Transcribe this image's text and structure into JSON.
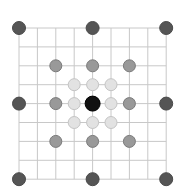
{
  "diagram": {
    "type": "grid-board",
    "grid": {
      "cells": 8,
      "lines": 9,
      "origin_x": 19,
      "origin_y": 28,
      "step_x": 18.4,
      "step_y": 18.9,
      "line_color": "#c8c8c8"
    },
    "styles": {
      "center": {
        "fill": "#111111",
        "stroke": "#000000",
        "r": 7.5
      },
      "outer": {
        "fill": "#555555",
        "stroke": "#4a4a4a",
        "r": 6.5
      },
      "middle": {
        "fill": "#999999",
        "stroke": "#7a7a7a",
        "r": 6
      },
      "inner": {
        "fill": "#e2e2e2",
        "stroke": "#c4c4c4",
        "r": 6
      }
    },
    "points": [
      {
        "col": 0,
        "row": 0,
        "kind": "outer"
      },
      {
        "col": 4,
        "row": 0,
        "kind": "outer"
      },
      {
        "col": 8,
        "row": 0,
        "kind": "outer"
      },
      {
        "col": 0,
        "row": 4,
        "kind": "outer"
      },
      {
        "col": 8,
        "row": 4,
        "kind": "outer"
      },
      {
        "col": 0,
        "row": 8,
        "kind": "outer"
      },
      {
        "col": 4,
        "row": 8,
        "kind": "outer"
      },
      {
        "col": 8,
        "row": 8,
        "kind": "outer"
      },
      {
        "col": 2,
        "row": 2,
        "kind": "middle"
      },
      {
        "col": 4,
        "row": 2,
        "kind": "middle"
      },
      {
        "col": 6,
        "row": 2,
        "kind": "middle"
      },
      {
        "col": 2,
        "row": 4,
        "kind": "middle"
      },
      {
        "col": 6,
        "row": 4,
        "kind": "middle"
      },
      {
        "col": 2,
        "row": 6,
        "kind": "middle"
      },
      {
        "col": 4,
        "row": 6,
        "kind": "middle"
      },
      {
        "col": 6,
        "row": 6,
        "kind": "middle"
      },
      {
        "col": 3,
        "row": 3,
        "kind": "inner"
      },
      {
        "col": 4,
        "row": 3,
        "kind": "inner"
      },
      {
        "col": 5,
        "row": 3,
        "kind": "inner"
      },
      {
        "col": 3,
        "row": 4,
        "kind": "inner"
      },
      {
        "col": 5,
        "row": 4,
        "kind": "inner"
      },
      {
        "col": 3,
        "row": 5,
        "kind": "inner"
      },
      {
        "col": 4,
        "row": 5,
        "kind": "inner"
      },
      {
        "col": 5,
        "row": 5,
        "kind": "inner"
      },
      {
        "col": 4,
        "row": 4,
        "kind": "center"
      }
    ]
  }
}
